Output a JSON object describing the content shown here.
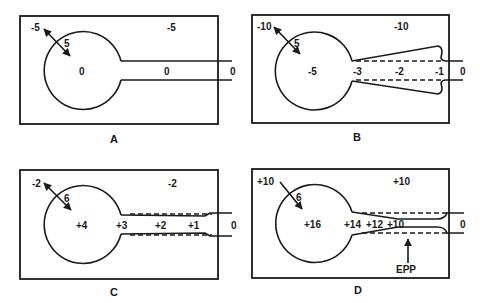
{
  "figure": {
    "panels": [
      {
        "id": "A",
        "caption": "A",
        "outer_left": "-5",
        "outer_right": "-5",
        "radius_label": "5",
        "bubble_center": "0",
        "tube_mid": "0",
        "tube_end": "0"
      },
      {
        "id": "B",
        "caption": "B",
        "outer_left": "-10",
        "outer_right": "-10",
        "radius_label": "5",
        "bubble_center": "-5",
        "tube_values": [
          "-3",
          "-2",
          "-1"
        ],
        "tube_end": "0"
      },
      {
        "id": "C",
        "caption": "C",
        "outer_left": "-2",
        "outer_right": "-2",
        "radius_label": "6",
        "bubble_center": "+4",
        "tube_values": [
          "+3",
          "+2",
          "+1"
        ],
        "tube_end": "0"
      },
      {
        "id": "D",
        "caption": "D",
        "outer_left": "+10",
        "outer_right": "+10",
        "radius_label": "6",
        "bubble_center": "+16",
        "tube_values": [
          "+14",
          "+12",
          "+10"
        ],
        "tube_end": "0",
        "annotation": "EPP"
      }
    ]
  }
}
